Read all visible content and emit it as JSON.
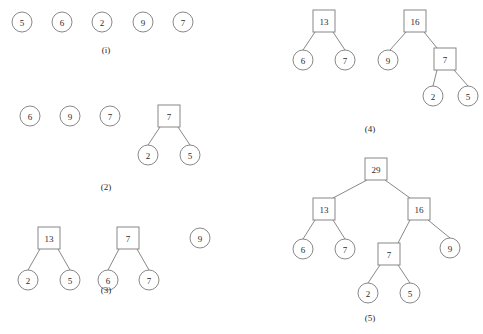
{
  "figure": {
    "background_color": "#ffffff",
    "stroke_color": "#7b7b7b",
    "text_color": "#2b2b2b",
    "width": 483,
    "height": 334
  },
  "panels": [
    {
      "id": "panel-i",
      "caption": "(i)",
      "caption_x": 106,
      "caption_y": 50,
      "nodes": [
        {
          "label": "5",
          "shape": "circle",
          "cx": 22,
          "cy": 22,
          "r": 10
        },
        {
          "label": "6",
          "shape": "circle",
          "cx": 62,
          "cy": 22,
          "r": 10
        },
        {
          "label": "2",
          "shape": "circle",
          "cx": 102,
          "cy": 22,
          "r": 10
        },
        {
          "label": "9",
          "shape": "circle",
          "cx": 143,
          "cy": 22,
          "r": 10
        },
        {
          "label": "7",
          "shape": "circle",
          "cx": 183,
          "cy": 22,
          "r": 10
        }
      ],
      "edges": []
    },
    {
      "id": "panel-2",
      "caption": "(2)",
      "caption_x": 106,
      "caption_y": 187,
      "nodes": [
        {
          "label": "6",
          "shape": "circle",
          "cx": 30,
          "cy": 116,
          "r": 10
        },
        {
          "label": "9",
          "shape": "circle",
          "cx": 70,
          "cy": 116,
          "r": 10
        },
        {
          "label": "7",
          "shape": "circle",
          "cx": 110,
          "cy": 116,
          "r": 10
        },
        {
          "label": "7",
          "shape": "square",
          "cx": 169,
          "cy": 116,
          "half": 11
        },
        {
          "label": "2",
          "shape": "circle",
          "cx": 148,
          "cy": 155,
          "r": 10
        },
        {
          "label": "5",
          "shape": "circle",
          "cx": 190,
          "cy": 155,
          "r": 10
        }
      ],
      "edges": [
        {
          "x1": 160,
          "y1": 127,
          "x2": 148,
          "y2": 145
        },
        {
          "x1": 178,
          "y1": 127,
          "x2": 190,
          "y2": 145
        }
      ]
    },
    {
      "id": "panel-3",
      "caption": "(3)",
      "caption_x": 106,
      "caption_y": 290,
      "nodes": [
        {
          "label": "13",
          "shape": "square",
          "cx": 49,
          "cy": 238,
          "half": 11
        },
        {
          "label": "2",
          "shape": "circle",
          "cx": 28,
          "cy": 280,
          "r": 10
        },
        {
          "label": "5",
          "shape": "circle",
          "cx": 70,
          "cy": 280,
          "r": 10
        },
        {
          "label": "7",
          "shape": "square",
          "cx": 128,
          "cy": 238,
          "half": 11
        },
        {
          "label": "6",
          "shape": "circle",
          "cx": 108,
          "cy": 280,
          "r": 10
        },
        {
          "label": "7",
          "shape": "circle",
          "cx": 149,
          "cy": 280,
          "r": 10
        },
        {
          "label": "9",
          "shape": "circle",
          "cx": 200,
          "cy": 238,
          "r": 10
        }
      ],
      "edges": [
        {
          "x1": 40,
          "y1": 249,
          "x2": 28,
          "y2": 270
        },
        {
          "x1": 58,
          "y1": 249,
          "x2": 70,
          "y2": 270
        },
        {
          "x1": 119,
          "y1": 249,
          "x2": 108,
          "y2": 270
        },
        {
          "x1": 137,
          "y1": 249,
          "x2": 149,
          "y2": 270
        }
      ]
    },
    {
      "id": "panel-4",
      "caption": "(4)",
      "caption_x": 370,
      "caption_y": 129,
      "nodes": [
        {
          "label": "13",
          "shape": "square",
          "cx": 324,
          "cy": 21,
          "half": 11
        },
        {
          "label": "6",
          "shape": "circle",
          "cx": 303,
          "cy": 60,
          "r": 10
        },
        {
          "label": "7",
          "shape": "circle",
          "cx": 345,
          "cy": 60,
          "r": 10
        },
        {
          "label": "16",
          "shape": "square",
          "cx": 415,
          "cy": 21,
          "half": 11
        },
        {
          "label": "9",
          "shape": "circle",
          "cx": 388,
          "cy": 60,
          "r": 10
        },
        {
          "label": "7",
          "shape": "square",
          "cx": 445,
          "cy": 59,
          "half": 11
        },
        {
          "label": "2",
          "shape": "circle",
          "cx": 433,
          "cy": 96,
          "r": 10
        },
        {
          "label": "5",
          "shape": "circle",
          "cx": 468,
          "cy": 96,
          "r": 10
        }
      ],
      "edges": [
        {
          "x1": 315,
          "y1": 32,
          "x2": 303,
          "y2": 50
        },
        {
          "x1": 333,
          "y1": 32,
          "x2": 345,
          "y2": 50
        },
        {
          "x1": 406,
          "y1": 32,
          "x2": 390,
          "y2": 50
        },
        {
          "x1": 424,
          "y1": 32,
          "x2": 437,
          "y2": 48
        },
        {
          "x1": 437,
          "y1": 70,
          "x2": 433,
          "y2": 86
        },
        {
          "x1": 454,
          "y1": 70,
          "x2": 468,
          "y2": 86
        }
      ]
    },
    {
      "id": "panel-5",
      "caption": "(5)",
      "caption_x": 370,
      "caption_y": 318,
      "nodes": [
        {
          "label": "29",
          "shape": "square",
          "cx": 376,
          "cy": 169,
          "half": 11
        },
        {
          "label": "13",
          "shape": "square",
          "cx": 324,
          "cy": 209,
          "half": 11
        },
        {
          "label": "6",
          "shape": "circle",
          "cx": 303,
          "cy": 249,
          "r": 10
        },
        {
          "label": "7",
          "shape": "circle",
          "cx": 345,
          "cy": 249,
          "r": 10
        },
        {
          "label": "16",
          "shape": "square",
          "cx": 419,
          "cy": 209,
          "half": 11
        },
        {
          "label": "7",
          "shape": "square",
          "cx": 389,
          "cy": 254,
          "half": 11
        },
        {
          "label": "2",
          "shape": "circle",
          "cx": 368,
          "cy": 293,
          "r": 10
        },
        {
          "label": "5",
          "shape": "circle",
          "cx": 410,
          "cy": 293,
          "r": 10
        },
        {
          "label": "9",
          "shape": "circle",
          "cx": 450,
          "cy": 248,
          "r": 10
        }
      ],
      "edges": [
        {
          "x1": 367,
          "y1": 180,
          "x2": 333,
          "y2": 198
        },
        {
          "x1": 385,
          "y1": 180,
          "x2": 410,
          "y2": 198
        },
        {
          "x1": 315,
          "y1": 220,
          "x2": 303,
          "y2": 239
        },
        {
          "x1": 333,
          "y1": 220,
          "x2": 345,
          "y2": 239
        },
        {
          "x1": 410,
          "y1": 220,
          "x2": 398,
          "y2": 243
        },
        {
          "x1": 428,
          "y1": 220,
          "x2": 450,
          "y2": 238
        },
        {
          "x1": 380,
          "y1": 265,
          "x2": 368,
          "y2": 283
        },
        {
          "x1": 398,
          "y1": 265,
          "x2": 410,
          "y2": 283
        }
      ]
    }
  ]
}
